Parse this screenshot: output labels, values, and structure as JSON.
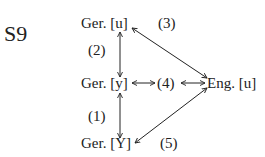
{
  "figure": {
    "label": "S9",
    "nodes": {
      "top": "Ger.  [u]",
      "middle": "Ger.  [y]",
      "bottom": "Ger.  [Y]",
      "right": "Eng.  [u]"
    },
    "edges": {
      "e1": "(1)",
      "e2": "(2)",
      "e3": "(3)",
      "e4": "(4)",
      "e5": "(5)"
    }
  }
}
